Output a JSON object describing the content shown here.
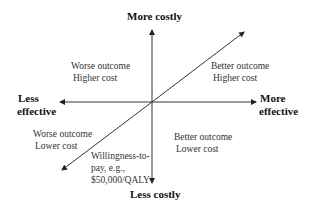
{
  "diagram": {
    "type": "cost-effectiveness plane",
    "axes": {
      "top": "More costly",
      "bottom": "Less costly",
      "left": [
        "Less",
        "effective"
      ],
      "right": [
        "More",
        "effective"
      ]
    },
    "quadrants": {
      "top_left": [
        "Worse outcome",
        "Higher cost"
      ],
      "top_right": [
        "Better outcome",
        "Higher cost"
      ],
      "bottom_left": [
        "Worse outcome",
        "Lower cost"
      ],
      "bottom_right": [
        "Better outcome",
        "Lower cost"
      ]
    },
    "threshold_line": [
      "Willingness-to-",
      "pay, e.g.,",
      "$50,000/QALY"
    ]
  }
}
